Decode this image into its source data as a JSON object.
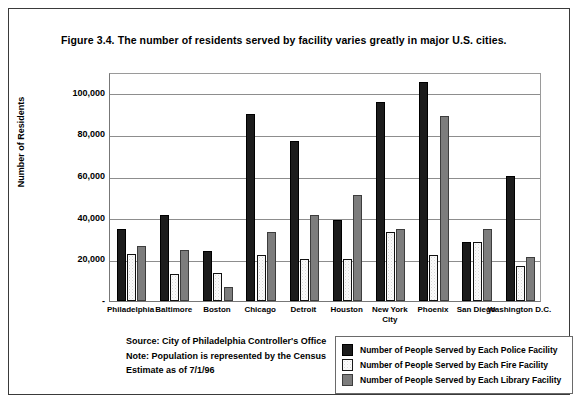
{
  "figure": {
    "title": "Figure 3.4. The number of residents served by facility varies greatly in major U.S. cities."
  },
  "notes": {
    "line1": "Source: City of Philadelphia Controller's Office",
    "line2": "Note: Population is represented by the Census",
    "line3": "Estimate as of 7/1/96"
  },
  "legend": {
    "items": [
      {
        "label": "Number of People Served by Each Police Facility",
        "swatch": "police",
        "color": "#1c1c1c"
      },
      {
        "label": "Number of People Served by Each Fire Facility",
        "swatch": "fire",
        "color": "#fcfcfc"
      },
      {
        "label": "Number of People Served by Each Library Facility",
        "swatch": "library",
        "color": "#7d7d7d"
      }
    ]
  },
  "chart_data": {
    "type": "bar",
    "title": "Figure 3.4. The number of residents served by facility varies greatly in major U.S. cities.",
    "xlabel": "",
    "ylabel": "Number of Residents",
    "ylim": [
      0,
      110000
    ],
    "ytick_values": [
      0,
      20000,
      40000,
      60000,
      80000,
      100000
    ],
    "ytick_labels": [
      "-",
      "20,000",
      "40,000",
      "60,000",
      "80,000",
      "100,000"
    ],
    "grid": true,
    "legend_position": "bottom-right",
    "categories": [
      "Philadelphia",
      "Baltimore",
      "Boston",
      "Chicago",
      "Detroit",
      "Houston",
      "New York City",
      "Phoenix",
      "San Diego",
      "Washington D.C."
    ],
    "category_label_lines": [
      [
        "Philadelphia"
      ],
      [
        "Baltimore"
      ],
      [
        "Boston"
      ],
      [
        "Chicago"
      ],
      [
        "Detroit"
      ],
      [
        "Houston"
      ],
      [
        "New York",
        "City"
      ],
      [
        "Phoenix"
      ],
      [
        "San Diego"
      ],
      [
        "Washington D.C."
      ]
    ],
    "series": [
      {
        "name": "Number of People Served by Each Police Facility",
        "key": "police",
        "color": "#1c1c1c",
        "values": [
          34500,
          41500,
          24000,
          90000,
          77000,
          39000,
          95500,
          105000,
          28500,
          60000
        ]
      },
      {
        "name": "Number of People Served by Each Fire Facility",
        "key": "fire",
        "color": "#fcfcfc",
        "values": [
          22500,
          13000,
          13500,
          22000,
          20000,
          20000,
          33000,
          22000,
          28500,
          17000
        ]
      },
      {
        "name": "Number of People Served by Each Library Facility",
        "key": "library",
        "color": "#7d7d7d",
        "values": [
          26500,
          24500,
          6500,
          33000,
          41500,
          51000,
          34500,
          89000,
          34500,
          21000
        ]
      }
    ]
  }
}
